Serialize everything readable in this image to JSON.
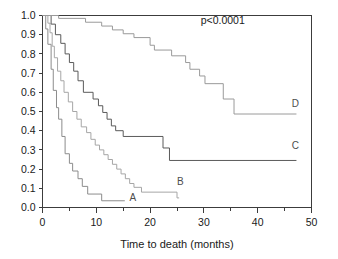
{
  "figure": {
    "caption_annotation": "p<0.0001"
  },
  "chart_data": {
    "type": "line",
    "title": "",
    "subtitle": "",
    "xlabel": "Time to death (months)",
    "ylabel": "",
    "xlim": [
      0,
      50
    ],
    "ylim": [
      0,
      1.0
    ],
    "grid": false,
    "legend_position": "inline-right",
    "x_ticks": [
      0,
      10,
      20,
      30,
      40,
      50
    ],
    "x_tick_labels": [
      "0",
      "10",
      "20",
      "30",
      "40",
      "50"
    ],
    "x_minor_ticks": [
      5,
      15,
      25,
      35,
      45
    ],
    "y_ticks": [
      0.0,
      0.1,
      0.2,
      0.3,
      0.4,
      0.5,
      0.6,
      0.7,
      0.8,
      0.9,
      1.0
    ],
    "y_tick_labels": [
      "0.0",
      "0.1",
      "0.2",
      "0.3",
      "0.4",
      "0.5",
      "0.6",
      "0.7",
      "0.8",
      "0.9",
      "1.0"
    ],
    "annotations": [
      {
        "text": "p<0.0001",
        "x": 33.5,
        "y": 0.955
      }
    ],
    "series": [
      {
        "name": "A",
        "label": "A",
        "color": "#8c8c8c",
        "label_x": 16.8,
        "label_y": 0.035,
        "points": [
          [
            0,
            1.0
          ],
          [
            0.6,
            1.0
          ],
          [
            0.6,
            0.93
          ],
          [
            1.0,
            0.93
          ],
          [
            1.0,
            0.85
          ],
          [
            1.6,
            0.85
          ],
          [
            1.6,
            0.72
          ],
          [
            2.0,
            0.72
          ],
          [
            2.0,
            0.61
          ],
          [
            2.6,
            0.61
          ],
          [
            2.6,
            0.52
          ],
          [
            3.0,
            0.52
          ],
          [
            3.0,
            0.46
          ],
          [
            3.6,
            0.46
          ],
          [
            3.6,
            0.37
          ],
          [
            4.2,
            0.37
          ],
          [
            4.2,
            0.28
          ],
          [
            5.0,
            0.28
          ],
          [
            5.0,
            0.23
          ],
          [
            5.6,
            0.23
          ],
          [
            5.6,
            0.19
          ],
          [
            6.6,
            0.19
          ],
          [
            6.6,
            0.15
          ],
          [
            7.4,
            0.15
          ],
          [
            7.4,
            0.11
          ],
          [
            8.4,
            0.11
          ],
          [
            8.4,
            0.07
          ],
          [
            11.0,
            0.07
          ],
          [
            11.0,
            0.035
          ],
          [
            15.3,
            0.035
          ]
        ]
      },
      {
        "name": "B",
        "label": "B",
        "color": "#a6a6a6",
        "label_x": 25.6,
        "label_y": 0.115,
        "points": [
          [
            0,
            1.0
          ],
          [
            1.0,
            1.0
          ],
          [
            1.0,
            0.96
          ],
          [
            1.4,
            0.96
          ],
          [
            1.4,
            0.91
          ],
          [
            1.8,
            0.91
          ],
          [
            1.8,
            0.84
          ],
          [
            2.2,
            0.84
          ],
          [
            2.2,
            0.78
          ],
          [
            2.8,
            0.78
          ],
          [
            2.8,
            0.71
          ],
          [
            3.4,
            0.71
          ],
          [
            3.4,
            0.66
          ],
          [
            4.0,
            0.66
          ],
          [
            4.0,
            0.6
          ],
          [
            4.8,
            0.6
          ],
          [
            4.8,
            0.55
          ],
          [
            5.6,
            0.55
          ],
          [
            5.6,
            0.5
          ],
          [
            6.4,
            0.5
          ],
          [
            6.4,
            0.46
          ],
          [
            7.2,
            0.46
          ],
          [
            7.2,
            0.42
          ],
          [
            8.2,
            0.42
          ],
          [
            8.2,
            0.39
          ],
          [
            9.0,
            0.39
          ],
          [
            9.0,
            0.355
          ],
          [
            9.8,
            0.355
          ],
          [
            9.8,
            0.325
          ],
          [
            10.6,
            0.325
          ],
          [
            10.6,
            0.3
          ],
          [
            11.4,
            0.3
          ],
          [
            11.4,
            0.275
          ],
          [
            12.2,
            0.275
          ],
          [
            12.2,
            0.25
          ],
          [
            13.0,
            0.25
          ],
          [
            13.0,
            0.225
          ],
          [
            13.8,
            0.225
          ],
          [
            13.8,
            0.2
          ],
          [
            14.6,
            0.2
          ],
          [
            14.6,
            0.175
          ],
          [
            15.4,
            0.175
          ],
          [
            15.4,
            0.15
          ],
          [
            16.2,
            0.15
          ],
          [
            16.2,
            0.125
          ],
          [
            17.0,
            0.125
          ],
          [
            17.0,
            0.105
          ],
          [
            18.4,
            0.105
          ],
          [
            18.4,
            0.08
          ],
          [
            25.0,
            0.08
          ],
          [
            25.0,
            0.05
          ],
          [
            25.4,
            0.05
          ]
        ]
      },
      {
        "name": "C",
        "label": "C",
        "color": "#5a5a5a",
        "label_x": 47.0,
        "label_y": 0.305,
        "points": [
          [
            0,
            1.0
          ],
          [
            1.6,
            1.0
          ],
          [
            1.6,
            0.955
          ],
          [
            2.4,
            0.955
          ],
          [
            2.4,
            0.9
          ],
          [
            3.4,
            0.9
          ],
          [
            3.4,
            0.855
          ],
          [
            4.2,
            0.855
          ],
          [
            4.2,
            0.8
          ],
          [
            5.0,
            0.8
          ],
          [
            5.0,
            0.755
          ],
          [
            5.8,
            0.755
          ],
          [
            5.8,
            0.71
          ],
          [
            6.6,
            0.71
          ],
          [
            6.6,
            0.66
          ],
          [
            7.6,
            0.66
          ],
          [
            7.6,
            0.6
          ],
          [
            9.4,
            0.6
          ],
          [
            9.4,
            0.565
          ],
          [
            10.4,
            0.565
          ],
          [
            10.4,
            0.53
          ],
          [
            11.2,
            0.53
          ],
          [
            11.2,
            0.495
          ],
          [
            12.0,
            0.495
          ],
          [
            12.0,
            0.46
          ],
          [
            12.8,
            0.46
          ],
          [
            12.8,
            0.425
          ],
          [
            13.6,
            0.425
          ],
          [
            13.6,
            0.4
          ],
          [
            15.0,
            0.4
          ],
          [
            15.0,
            0.37
          ],
          [
            22.4,
            0.37
          ],
          [
            22.4,
            0.31
          ],
          [
            23.6,
            0.31
          ],
          [
            23.6,
            0.245
          ],
          [
            47.2,
            0.245
          ]
        ]
      },
      {
        "name": "D",
        "label": "D",
        "color": "#9a9a9a",
        "label_x": 47.0,
        "label_y": 0.525,
        "points": [
          [
            0,
            1.0
          ],
          [
            3.0,
            1.0
          ],
          [
            3.0,
            0.985
          ],
          [
            8.0,
            0.985
          ],
          [
            8.0,
            0.965
          ],
          [
            11.0,
            0.965
          ],
          [
            11.0,
            0.945
          ],
          [
            13.0,
            0.945
          ],
          [
            13.0,
            0.925
          ],
          [
            15.0,
            0.925
          ],
          [
            15.0,
            0.905
          ],
          [
            17.0,
            0.905
          ],
          [
            17.0,
            0.885
          ],
          [
            20.0,
            0.885
          ],
          [
            20.0,
            0.845
          ],
          [
            20.8,
            0.845
          ],
          [
            20.8,
            0.82
          ],
          [
            24.0,
            0.82
          ],
          [
            24.0,
            0.79
          ],
          [
            26.6,
            0.79
          ],
          [
            26.6,
            0.755
          ],
          [
            27.4,
            0.755
          ],
          [
            27.4,
            0.72
          ],
          [
            29.2,
            0.72
          ],
          [
            29.2,
            0.685
          ],
          [
            30.2,
            0.685
          ],
          [
            30.2,
            0.645
          ],
          [
            33.6,
            0.645
          ],
          [
            33.6,
            0.565
          ],
          [
            35.6,
            0.565
          ],
          [
            35.6,
            0.487
          ],
          [
            47.2,
            0.487
          ]
        ]
      }
    ]
  }
}
